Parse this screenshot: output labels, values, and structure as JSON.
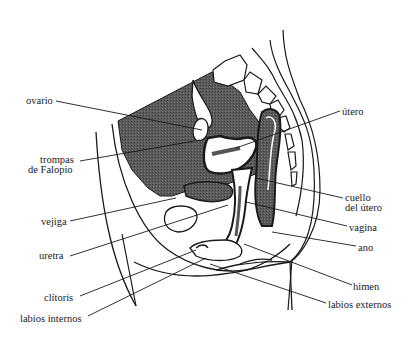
{
  "diagram": {
    "type": "anatomical-cross-section",
    "colors": {
      "fill_dark": "#555555",
      "line": "#1a1a1a",
      "background": "#ffffff"
    },
    "labels_left": [
      {
        "id": "ovario",
        "text": "ovario",
        "x": 26,
        "y": 96
      },
      {
        "id": "trompas",
        "text": "trompas",
        "x": 40,
        "y": 155
      },
      {
        "id": "de-falopio",
        "text": "de Falopio",
        "x": 28,
        "y": 165
      },
      {
        "id": "vejiga",
        "text": "vejiga",
        "x": 41,
        "y": 217
      },
      {
        "id": "uretra",
        "text": "uretra",
        "x": 39,
        "y": 251
      },
      {
        "id": "clitoris",
        "text": "clítoris",
        "x": 44,
        "y": 293
      },
      {
        "id": "labios-internos",
        "text": "labios internos",
        "x": 20,
        "y": 314
      }
    ],
    "labels_right": [
      {
        "id": "utero",
        "text": "útero",
        "x": 342,
        "y": 107
      },
      {
        "id": "cuello",
        "text": "cuello",
        "x": 345,
        "y": 193
      },
      {
        "id": "del-utero",
        "text": "del útero",
        "x": 345,
        "y": 203
      },
      {
        "id": "vagina",
        "text": "vagina",
        "x": 349,
        "y": 223
      },
      {
        "id": "ano",
        "text": "ano",
        "x": 358,
        "y": 243
      },
      {
        "id": "himen",
        "text": "himen",
        "x": 353,
        "y": 282
      },
      {
        "id": "labios-externos",
        "text": "labios externos",
        "x": 328,
        "y": 300
      }
    ]
  }
}
